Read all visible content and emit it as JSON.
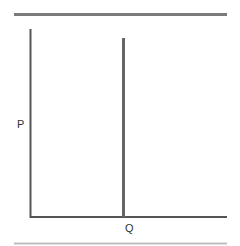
{
  "diagram": {
    "type": "supply-demand",
    "y_axis_label": "P",
    "x_axis_label": "Q",
    "curves": [
      {
        "name": "vertical-supply",
        "orientation": "vertical",
        "position_label": "Q"
      }
    ],
    "colors": {
      "rule": "#7a7a7a",
      "axis": "#555555",
      "curve": "#666666",
      "text": "#333333"
    }
  }
}
